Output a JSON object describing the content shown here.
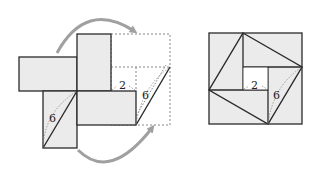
{
  "colors": {
    "fill": "#ebebeb",
    "stroke": "#2a2a2a",
    "dashed": "#888888",
    "arrow": "#a0a0a0",
    "inner_fill": "#ffffff"
  },
  "left_figure": {
    "labels": {
      "diagonal_left": "6",
      "inner_gap": "2",
      "diagonal_right": "6"
    }
  },
  "right_figure": {
    "labels": {
      "inner_side": "2",
      "hypotenuse": "6"
    }
  }
}
